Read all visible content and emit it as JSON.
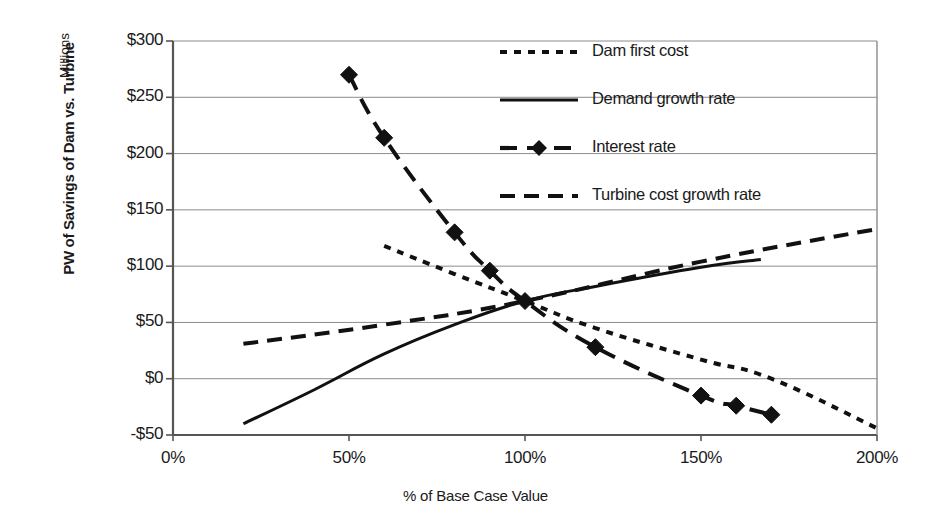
{
  "chart_data": {
    "type": "line",
    "title": "",
    "xlabel": "% of Base Case Value",
    "ylabel": "PW of Savings of Dam vs. Turbine",
    "y_unit_note": "Millions",
    "xlim": [
      0,
      200
    ],
    "ylim": [
      -50,
      300
    ],
    "xticks": [
      "0%",
      "50%",
      "100%",
      "150%",
      "200%"
    ],
    "xtick_values": [
      0,
      50,
      100,
      150,
      200
    ],
    "yticks": [
      "$300",
      "$250",
      "$200",
      "$150",
      "$100",
      "$50",
      "$0",
      "-$50"
    ],
    "ytick_values": [
      300,
      250,
      200,
      150,
      100,
      50,
      0,
      -50
    ],
    "grid": "horizontal",
    "legend_position": "top-right-inside",
    "series": [
      {
        "name": "Dam first cost",
        "style": "short-dash",
        "marker": "none",
        "x": [
          60,
          80,
          100,
          120,
          150,
          170,
          200
        ],
        "y": [
          118,
          93,
          69,
          45,
          17,
          0,
          -44
        ]
      },
      {
        "name": "Demand growth rate",
        "style": "solid",
        "marker": "none",
        "x": [
          20,
          40,
          60,
          80,
          100,
          120,
          150,
          167
        ],
        "y": [
          -40,
          -10,
          22,
          48,
          69,
          82,
          99,
          106
        ]
      },
      {
        "name": "Interest rate",
        "style": "long-dash",
        "marker": "diamond",
        "x": [
          50,
          60,
          80,
          90,
          100,
          120,
          150,
          160,
          170
        ],
        "y": [
          270,
          214,
          130,
          96,
          69,
          28,
          -15,
          -24,
          -32
        ]
      },
      {
        "name": "Turbine cost growth rate",
        "style": "dash",
        "marker": "none",
        "x": [
          20,
          60,
          100,
          150,
          200
        ],
        "y": [
          31,
          48,
          69,
          104,
          133
        ]
      }
    ]
  },
  "legend": {
    "items": [
      {
        "label": "Dam first cost"
      },
      {
        "label": "Demand growth rate"
      },
      {
        "label": "Interest rate"
      },
      {
        "label": "Turbine cost growth rate"
      }
    ]
  },
  "axes": {
    "y_title": "PW of Savings of Dam vs. Turbine",
    "y_unit": "Millions",
    "x_title": "% of Base Case Value"
  }
}
